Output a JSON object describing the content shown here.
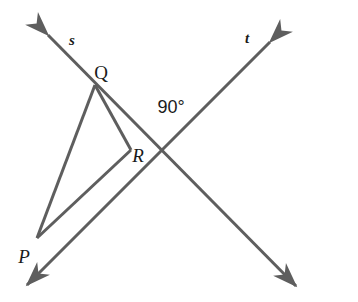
{
  "figure": {
    "type": "geometry-diagram",
    "width": 358,
    "height": 302,
    "background_color": "#ffffff",
    "stroke_color": "#5e5e5e",
    "text_color": "#1a1a1a",
    "stroke_width": 3
  },
  "labels": {
    "line_s": "s",
    "line_t": "t",
    "point_q": "Q",
    "point_r": "R",
    "point_p": "P",
    "angle": "90°"
  },
  "label_positions": {
    "line_s": {
      "x": 72,
      "y": 40
    },
    "line_t": {
      "x": 247,
      "y": 38
    },
    "point_q": {
      "x": 101,
      "y": 72
    },
    "point_r": {
      "x": 138,
      "y": 155
    },
    "point_p": {
      "x": 24,
      "y": 256
    },
    "angle": {
      "x": 171,
      "y": 107
    }
  },
  "geometry": {
    "points": {
      "Q": {
        "x": 95,
        "y": 85
      },
      "R": {
        "x": 131,
        "y": 150
      },
      "P": {
        "x": 37,
        "y": 238
      },
      "intersection": {
        "x": 161,
        "y": 157
      }
    },
    "line_s": {
      "name": "s",
      "from": {
        "x": 48,
        "y": 35
      },
      "to": {
        "x": 296,
        "y": 286
      },
      "arrows": "both",
      "passes_through": [
        "Q",
        "intersection"
      ]
    },
    "line_t": {
      "name": "t",
      "from": {
        "x": 270,
        "y": 42
      },
      "to": {
        "x": 27,
        "y": 285
      },
      "arrows": "both",
      "passes_through": [
        "intersection",
        "P"
      ]
    },
    "triangle": {
      "vertices": [
        "Q",
        "R",
        "P"
      ],
      "segments": [
        {
          "from": "Q",
          "to": "R"
        },
        {
          "from": "R",
          "to": "P"
        },
        {
          "from": "P",
          "to": "Q"
        }
      ]
    }
  }
}
